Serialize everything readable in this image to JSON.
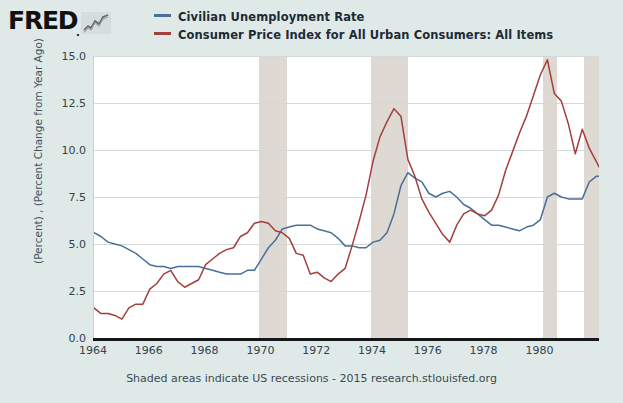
{
  "branding": {
    "wordmark": "FRED",
    "dot": ".",
    "spark_icon": "line-chart-icon"
  },
  "legend": {
    "position": "top",
    "entries": [
      {
        "label": "Civilian Unemployment Rate",
        "color": "#4a6f96"
      },
      {
        "label": "Consumer Price Index for All Urban Consumers: All Items",
        "color": "#a43f3c"
      }
    ]
  },
  "footer": {
    "note": "Shaded areas indicate US recessions - 2015 research.stlouisfed.org"
  },
  "axes": {
    "ylabel": "(Percent) , (Percent Change from Year Ago)",
    "yticks": [
      "0.0",
      "2.5",
      "5.0",
      "7.5",
      "10.0",
      "12.5",
      "15.0"
    ],
    "xticks": [
      "1964",
      "1966",
      "1968",
      "1970",
      "1972",
      "1974",
      "1976",
      "1978",
      "1980"
    ]
  },
  "chart_data": {
    "type": "line",
    "title": "",
    "xlabel": "",
    "ylabel": "(Percent) , (Percent Change from Year Ago)",
    "xlim": [
      1964.0,
      1982.1
    ],
    "ylim": [
      0.0,
      15.0
    ],
    "yticks": [
      0.0,
      2.5,
      5.0,
      7.5,
      10.0,
      12.5,
      15.0
    ],
    "xticks": [
      1964,
      1966,
      1968,
      1970,
      1972,
      1974,
      1976,
      1978,
      1980
    ],
    "grid": true,
    "legend_position": "top",
    "shaded_regions_label": "US recessions",
    "shaded_regions": [
      {
        "start": 1969.92,
        "end": 1970.92
      },
      {
        "start": 1973.92,
        "end": 1975.25
      },
      {
        "start": 1980.08,
        "end": 1980.58
      },
      {
        "start": 1981.58,
        "end": 1982.1
      }
    ],
    "series": [
      {
        "name": "Civilian Unemployment Rate",
        "color": "#4a6f96",
        "x": [
          1964.0,
          1964.25,
          1964.5,
          1964.75,
          1965.0,
          1965.25,
          1965.5,
          1965.75,
          1966.0,
          1966.25,
          1966.5,
          1966.75,
          1967.0,
          1967.25,
          1967.5,
          1967.75,
          1968.0,
          1968.25,
          1968.5,
          1968.75,
          1969.0,
          1969.25,
          1969.5,
          1969.75,
          1970.0,
          1970.25,
          1970.5,
          1970.75,
          1971.0,
          1971.25,
          1971.5,
          1971.75,
          1972.0,
          1972.25,
          1972.5,
          1972.75,
          1973.0,
          1973.25,
          1973.5,
          1973.75,
          1974.0,
          1974.25,
          1974.5,
          1974.75,
          1975.0,
          1975.25,
          1975.5,
          1975.75,
          1976.0,
          1976.25,
          1976.5,
          1976.75,
          1977.0,
          1977.25,
          1977.5,
          1977.75,
          1978.0,
          1978.25,
          1978.5,
          1978.75,
          1979.0,
          1979.25,
          1979.5,
          1979.75,
          1980.0,
          1980.25,
          1980.5,
          1980.75,
          1981.0,
          1981.25,
          1981.5,
          1981.75,
          1982.0,
          1982.1
        ],
        "values": [
          5.6,
          5.4,
          5.1,
          5.0,
          4.9,
          4.7,
          4.5,
          4.2,
          3.9,
          3.8,
          3.8,
          3.7,
          3.8,
          3.8,
          3.8,
          3.8,
          3.7,
          3.6,
          3.5,
          3.4,
          3.4,
          3.4,
          3.6,
          3.6,
          4.2,
          4.8,
          5.2,
          5.8,
          5.9,
          6.0,
          6.0,
          6.0,
          5.8,
          5.7,
          5.6,
          5.3,
          4.9,
          4.9,
          4.8,
          4.8,
          5.1,
          5.2,
          5.6,
          6.6,
          8.1,
          8.8,
          8.5,
          8.3,
          7.7,
          7.5,
          7.7,
          7.8,
          7.5,
          7.1,
          6.9,
          6.6,
          6.3,
          6.0,
          6.0,
          5.9,
          5.8,
          5.7,
          5.9,
          6.0,
          6.3,
          7.5,
          7.7,
          7.5,
          7.4,
          7.4,
          7.4,
          8.3,
          8.6,
          8.6
        ]
      },
      {
        "name": "Consumer Price Index for All Urban Consumers: All Items",
        "color": "#a43f3c",
        "x": [
          1964.0,
          1964.25,
          1964.5,
          1964.75,
          1965.0,
          1965.25,
          1965.5,
          1965.75,
          1966.0,
          1966.25,
          1966.5,
          1966.75,
          1967.0,
          1967.25,
          1967.5,
          1967.75,
          1968.0,
          1968.25,
          1968.5,
          1968.75,
          1969.0,
          1969.25,
          1969.5,
          1969.75,
          1970.0,
          1970.25,
          1970.5,
          1970.75,
          1971.0,
          1971.25,
          1971.5,
          1971.75,
          1972.0,
          1972.25,
          1972.5,
          1972.75,
          1973.0,
          1973.25,
          1973.5,
          1973.75,
          1974.0,
          1974.25,
          1974.5,
          1974.75,
          1975.0,
          1975.25,
          1975.5,
          1975.75,
          1976.0,
          1976.25,
          1976.5,
          1976.75,
          1977.0,
          1977.25,
          1977.5,
          1977.75,
          1978.0,
          1978.25,
          1978.5,
          1978.75,
          1979.0,
          1979.25,
          1979.5,
          1979.75,
          1980.0,
          1980.25,
          1980.5,
          1980.75,
          1981.0,
          1981.25,
          1981.5,
          1981.75,
          1982.0,
          1982.1
        ],
        "values": [
          1.6,
          1.3,
          1.3,
          1.2,
          1.0,
          1.6,
          1.8,
          1.8,
          2.6,
          2.9,
          3.4,
          3.6,
          3.0,
          2.7,
          2.9,
          3.1,
          3.9,
          4.2,
          4.5,
          4.7,
          4.8,
          5.4,
          5.6,
          6.1,
          6.2,
          6.1,
          5.7,
          5.6,
          5.3,
          4.5,
          4.4,
          3.4,
          3.5,
          3.2,
          3.0,
          3.4,
          3.7,
          4.9,
          6.2,
          7.6,
          9.4,
          10.7,
          11.5,
          12.2,
          11.8,
          9.5,
          8.6,
          7.4,
          6.7,
          6.1,
          5.5,
          5.1,
          6.0,
          6.6,
          6.8,
          6.6,
          6.5,
          6.8,
          7.6,
          8.9,
          9.9,
          10.9,
          11.8,
          12.9,
          14.0,
          14.8,
          13.0,
          12.6,
          11.4,
          9.8,
          11.1,
          10.1,
          9.4,
          9.1
        ]
      }
    ]
  }
}
